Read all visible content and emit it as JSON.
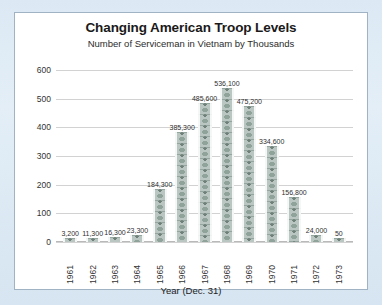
{
  "page": {
    "background_color": "#d9e7f2",
    "panel_color": "#ffffff",
    "panel_border_color": "#9fb3c4"
  },
  "chart_data": {
    "type": "bar",
    "title": "Changing American Troop Levels",
    "subtitle": "Number of Serviceman in Vietnam by Thousands",
    "xlabel": "Year (Dec. 31)",
    "ylabel": "",
    "ylim": [
      0,
      600
    ],
    "yticks": [
      600,
      500,
      400,
      300,
      200,
      100,
      0
    ],
    "ytick_labels": [
      "600",
      "500",
      "400",
      "300",
      "200",
      "100",
      "0"
    ],
    "grid": true,
    "legend": false,
    "bar_color": "#b9c6c1",
    "bar_style": "soldier-pictogram-stack",
    "categories": [
      "1961",
      "1962",
      "1963",
      "1964",
      "1965",
      "1966",
      "1967",
      "1968",
      "1969",
      "1970",
      "1971",
      "1972",
      "1973"
    ],
    "values": [
      3200,
      11300,
      16300,
      23300,
      184300,
      385300,
      485600,
      536100,
      475200,
      334600,
      156800,
      24000,
      50
    ],
    "value_labels": [
      "3,200",
      "11,300",
      "16,300",
      "23,300",
      "184,300",
      "385,300",
      "485,600",
      "536,100",
      "475,200",
      "334,600",
      "156,800",
      "24,000",
      "50"
    ],
    "values_in_thousands": [
      3.2,
      11.3,
      16.3,
      23.3,
      184.3,
      385.3,
      485.6,
      536.1,
      475.2,
      334.6,
      156.8,
      24.0,
      0.05
    ]
  }
}
